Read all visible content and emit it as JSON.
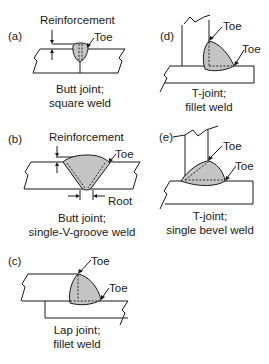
{
  "figure": {
    "panels": [
      {
        "id": "a",
        "label": "(a)",
        "annotations": [
          "Reinforcement",
          "Toe"
        ],
        "caption_line1": "Butt joint;",
        "caption_line2": "square weld"
      },
      {
        "id": "b",
        "label": "(b)",
        "annotations": [
          "Reinforcement",
          "Toe",
          "Root"
        ],
        "caption_line1": "Butt joint;",
        "caption_line2": "single-V-groove weld"
      },
      {
        "id": "c",
        "label": "(c)",
        "annotations": [
          "Toe",
          "Toe"
        ],
        "caption_line1": "Lap joint;",
        "caption_line2": "fillet weld"
      },
      {
        "id": "d",
        "label": "(d)",
        "annotations": [
          "Toe",
          "Toe"
        ],
        "caption_line1": "T-joint;",
        "caption_line2": "fillet weld"
      },
      {
        "id": "e",
        "label": "(e)",
        "annotations": [
          "Toe",
          "Toe"
        ],
        "caption_line1": "T-joint;",
        "caption_line2": "single bevel weld"
      }
    ],
    "colors": {
      "weld_fill": "#c4c4c4",
      "line": "#1a1a1a",
      "background": "#ffffff"
    }
  }
}
